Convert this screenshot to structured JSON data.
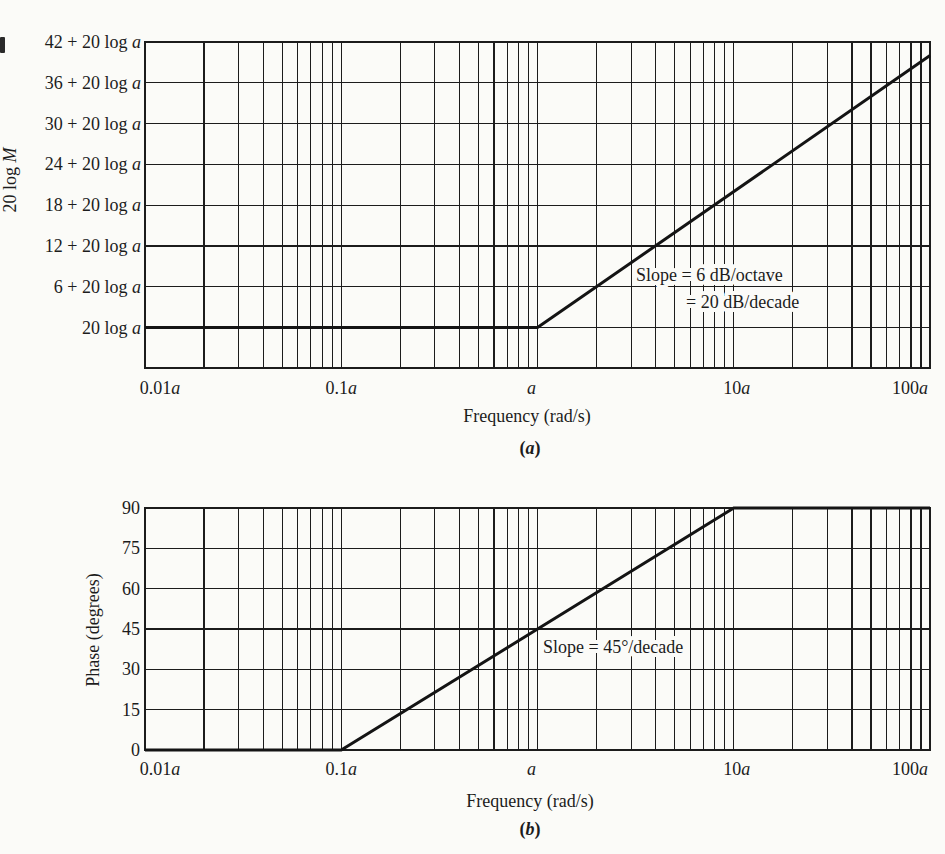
{
  "page": {
    "background": "#fbfbf8",
    "ink": "#1c1c1c"
  },
  "chart_data": [
    {
      "type": "line",
      "name": "bode-magnitude-plot",
      "x_scale": "log",
      "x_range": [
        0.01,
        100
      ],
      "x_unit": "multiples of a (rad/s)",
      "x_ticks": [
        {
          "value": 0.01,
          "label": "0.01a"
        },
        {
          "value": 0.1,
          "label": "0.1a"
        },
        {
          "value": 1,
          "label": "a"
        },
        {
          "value": 10,
          "label": "10a"
        },
        {
          "value": 100,
          "label": "100a"
        }
      ],
      "xlabel": "Frequency (rad/s)",
      "ylabel": "20 log M",
      "y_range": [
        -6,
        42
      ],
      "y_grid_step": 6,
      "y_unit": "dB relative to 20 log a",
      "y_ticks": [
        {
          "value": 42,
          "label": "42 + 20 log a"
        },
        {
          "value": 36,
          "label": "36 + 20 log a"
        },
        {
          "value": 30,
          "label": "30 + 20 log a"
        },
        {
          "value": 24,
          "label": "24 + 20 log a"
        },
        {
          "value": 18,
          "label": "18 + 20 log a"
        },
        {
          "value": 12,
          "label": "12 + 20 log a"
        },
        {
          "value": 6,
          "label": "6 + 20 log a"
        },
        {
          "value": 0,
          "label": "20 log a"
        }
      ],
      "series": [
        {
          "name": "magnitude-asymptote",
          "points": [
            [
              0.01,
              0
            ],
            [
              1,
              0
            ],
            [
              100,
              40
            ]
          ]
        }
      ],
      "annotations": [
        "Slope = 6 dB/octave",
        "= 20 dB/decade"
      ],
      "caption": "(a)",
      "grid": "on, log decades with minor lines at 2-9",
      "legend": "none"
    },
    {
      "type": "line",
      "name": "bode-phase-plot",
      "x_scale": "log",
      "x_range": [
        0.01,
        100
      ],
      "x_unit": "multiples of a (rad/s)",
      "x_ticks": [
        {
          "value": 0.01,
          "label": "0.01a"
        },
        {
          "value": 0.1,
          "label": "0.1a"
        },
        {
          "value": 1,
          "label": "a"
        },
        {
          "value": 10,
          "label": "10a"
        },
        {
          "value": 100,
          "label": "100a"
        }
      ],
      "xlabel": "Frequency (rad/s)",
      "ylabel": "Phase (degrees)",
      "y_range": [
        0,
        90
      ],
      "y_grid_step": 15,
      "y_unit": "degrees",
      "y_ticks": [
        {
          "value": 90,
          "label": "90"
        },
        {
          "value": 75,
          "label": "75"
        },
        {
          "value": 60,
          "label": "60"
        },
        {
          "value": 45,
          "label": "45"
        },
        {
          "value": 30,
          "label": "30"
        },
        {
          "value": 15,
          "label": "15"
        },
        {
          "value": 0,
          "label": "0"
        }
      ],
      "series": [
        {
          "name": "phase-asymptote",
          "points": [
            [
              0.01,
              0
            ],
            [
              0.1,
              0
            ],
            [
              10,
              90
            ],
            [
              100,
              90
            ]
          ]
        }
      ],
      "annotations": [
        "Slope = 45°/decade"
      ],
      "caption": "(b)",
      "grid": "on, log decades with minor lines at 2-9",
      "legend": "none"
    }
  ]
}
